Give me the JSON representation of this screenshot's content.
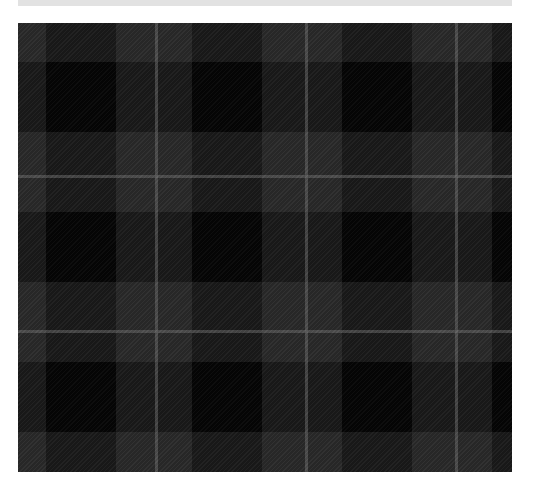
{
  "image": {
    "subject": "tartan fabric swatch",
    "colors": {
      "base_grey": "#2a2a2a",
      "dark_band": "#181818",
      "black_block": "#050505",
      "overcheck_line": "#6e6e6e",
      "caption_bar": "#e2e2e2"
    },
    "caption_bar": {
      "text": ""
    },
    "pattern": {
      "sett_px": 150,
      "vertical_bands_x": [
        28,
        174,
        324,
        474
      ],
      "horizontal_bands_y": [
        39,
        189,
        339
      ],
      "band_width_px": 70,
      "overcheck_lines_x": [
        137,
        287,
        437
      ],
      "overcheck_lines_y": [
        152,
        307
      ]
    }
  }
}
